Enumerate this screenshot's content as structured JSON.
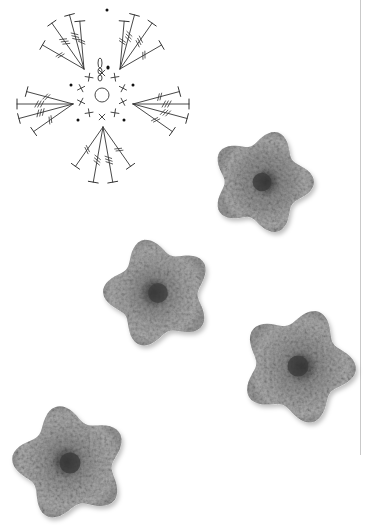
{
  "page": {
    "background": "#ffffff",
    "rule_color": "#c9c9c9"
  },
  "crochet_chart": {
    "title": "",
    "description": "Five-petal flower crochet symbol chart",
    "center": [
      102,
      95
    ],
    "magic_ring_radius": 7,
    "round1": {
      "stitch": "single-crochet",
      "symbol": "x",
      "count": 10,
      "radius": 22
    },
    "chain_start_symbols": [
      "0",
      "0",
      "0"
    ],
    "slip_stitch_dots": 6,
    "petals": [
      {
        "name": "top-left",
        "base": [
          84,
          69
        ]
      },
      {
        "name": "top-right",
        "base": [
          120,
          69
        ]
      },
      {
        "name": "left",
        "base": [
          73,
          104
        ]
      },
      {
        "name": "right",
        "base": [
          133,
          104
        ]
      },
      {
        "name": "bottom",
        "base": [
          103,
          127
        ]
      }
    ],
    "petal_stitches": [
      "treble",
      "double-treble",
      "double-treble",
      "treble"
    ],
    "line_color": "#333333"
  },
  "photos": [
    {
      "name": "flower-photo-1",
      "cx": 262,
      "cy": 182,
      "r": 52,
      "color": "#9a9a9a",
      "center_color": "#3a3a3a"
    },
    {
      "name": "flower-photo-2",
      "cx": 158,
      "cy": 293,
      "r": 55,
      "color": "#a3a3a3",
      "center_color": "#3c3c3c"
    },
    {
      "name": "flower-photo-3",
      "cx": 298,
      "cy": 366,
      "r": 58,
      "color": "#a0a0a0",
      "center_color": "#3a3a3a"
    },
    {
      "name": "flower-photo-4",
      "cx": 70,
      "cy": 463,
      "r": 58,
      "color": "#a2a2a2",
      "center_color": "#3a3a3a"
    }
  ]
}
